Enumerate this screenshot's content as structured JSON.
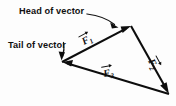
{
  "figure": {
    "kind": "vector-triangle-diagram",
    "background_color": "#fdfdfd",
    "ink_color": "#0d0d0d",
    "width": 176,
    "height": 106
  },
  "annotations": {
    "head_label": "Head of vector",
    "tail_label": "Tail of vector"
  },
  "vectors": [
    {
      "id": "F1",
      "letter": "F",
      "subscript": "1",
      "overbar": "arrow",
      "from_vertex": "tail",
      "to_vertex": "apex",
      "label_rotation_deg": -36
    },
    {
      "id": "F2",
      "letter": "F",
      "subscript": "2",
      "overbar": "arrow",
      "from_vertex": "apex",
      "to_vertex": "lower-right",
      "label_rotation_deg": 58
    },
    {
      "id": "F3",
      "letter": "F",
      "subscript": "3",
      "overbar": "arrow",
      "from_vertex": "lower-right",
      "to_vertex": "tail",
      "label_rotation_deg": -12
    }
  ],
  "vertices": {
    "tail": {
      "x": 62,
      "y": 62
    },
    "apex": {
      "x": 131,
      "y": 26
    },
    "lower_right": {
      "x": 169,
      "y": 94
    }
  }
}
